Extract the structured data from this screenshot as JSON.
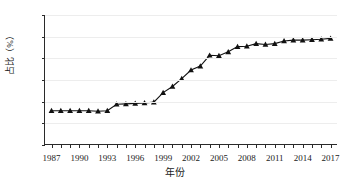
{
  "chart_data": {
    "type": "line",
    "title": "",
    "xlabel": "年份",
    "ylabel": "占比（%）",
    "xlim": [
      1986.3,
      2017.8
    ],
    "ylim": [
      0,
      30
    ],
    "yticks": [
      0,
      5,
      10,
      15,
      20,
      25,
      30
    ],
    "xticks": [
      1987,
      1990,
      1993,
      1996,
      1999,
      2002,
      2005,
      2008,
      2011,
      2014,
      2017
    ],
    "grid": true,
    "grid_axis": "y",
    "legend": "none",
    "marker": "triangle",
    "marker_color": "#111111",
    "line_color": "#111111",
    "series": [
      {
        "name": "占比（%）",
        "x": [
          1987,
          1988,
          1989,
          1990,
          1991,
          1992,
          1993,
          1994,
          1995,
          1996,
          1997,
          1998,
          1999,
          2000,
          2001,
          2002,
          2003,
          2004,
          2005,
          2006,
          2007,
          2008,
          2009,
          2010,
          2011,
          2012,
          2013,
          2014,
          2015,
          2016,
          2017
        ],
        "values": [
          7.9,
          7.9,
          7.9,
          7.9,
          7.9,
          7.8,
          7.9,
          9.4,
          9.5,
          9.6,
          9.7,
          9.9,
          12.1,
          13.5,
          15.3,
          17.3,
          18.2,
          20.7,
          20.6,
          21.5,
          22.7,
          22.8,
          23.4,
          23.2,
          23.4,
          24.0,
          24.2,
          24.2,
          24.3,
          24.4,
          24.6
        ]
      }
    ]
  }
}
